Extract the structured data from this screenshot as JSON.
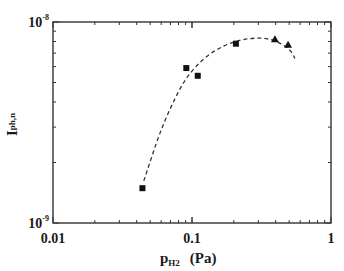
{
  "chart_data": {
    "type": "scatter",
    "title": "",
    "xlabel": "p_H2 (Pa)",
    "xlabel_parts": {
      "main": "p",
      "sub": "H2",
      "unit": "(Pa)"
    },
    "ylabel": "I_ph,n",
    "ylabel_parts": {
      "main": "I",
      "sub": "ph,n"
    },
    "xscale": "log",
    "yscale": "log",
    "xlim": [
      0.01,
      1
    ],
    "ylim": [
      1e-09,
      1e-08
    ],
    "x_ticks": [
      {
        "value": 0.01,
        "label": "0.01"
      },
      {
        "value": 0.1,
        "label": "0.1"
      },
      {
        "value": 1,
        "label": "1"
      }
    ],
    "y_ticks": [
      {
        "value": 1e-09,
        "base": "10",
        "exp": "-9"
      },
      {
        "value": 1e-08,
        "base": "10",
        "exp": "-8"
      }
    ],
    "grid": false,
    "legend": null,
    "series": [
      {
        "name": "squares",
        "marker": "square",
        "x": [
          0.044,
          0.091,
          0.11,
          0.207
        ],
        "y": [
          1.49e-09,
          5.9e-09,
          5.4e-09,
          7.8e-09
        ]
      },
      {
        "name": "triangles",
        "marker": "triangle",
        "x": [
          0.395,
          0.491
        ],
        "y": [
          8.2e-09,
          7.7e-09
        ]
      },
      {
        "name": "fit",
        "style": "dashed-line",
        "x": [
          0.045,
          0.06,
          0.08,
          0.1,
          0.13,
          0.17,
          0.22,
          0.28,
          0.35,
          0.42,
          0.5,
          0.55
        ],
        "y": [
          1.62e-09,
          2.9e-09,
          4.5e-09,
          5.7e-09,
          6.8e-09,
          7.6e-09,
          8.1e-09,
          8.3e-09,
          8.25e-09,
          7.9e-09,
          7.3e-09,
          6.6e-09
        ]
      }
    ]
  },
  "colors": {
    "axis": "#333333",
    "marker": "#111111",
    "curve": "#333333",
    "background": "#ffffff"
  }
}
